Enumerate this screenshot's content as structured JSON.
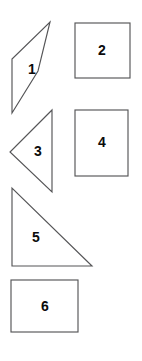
{
  "figure": {
    "background_color": "#ffffff",
    "outline_color": "#555557",
    "label_color": "#0b0b0b",
    "canvas": {
      "width": 142,
      "height": 361
    }
  },
  "shapes": [
    {
      "label": "1",
      "type": "parallelogram",
      "points": "50,22 38,71 12,113 12,59",
      "label_x": 32,
      "label_y": 70
    },
    {
      "label": "2",
      "type": "square",
      "x": 75,
      "y": 23,
      "width": 55,
      "height": 55,
      "label_x": 102,
      "label_y": 51
    },
    {
      "label": "3",
      "type": "triangle-left",
      "points": "52,110 52,192 10,152",
      "label_x": 38,
      "label_y": 152
    },
    {
      "label": "4",
      "type": "rectangle-vertical",
      "x": 75,
      "y": 110,
      "width": 53,
      "height": 66,
      "label_x": 102,
      "label_y": 143
    },
    {
      "label": "5",
      "type": "triangle-right",
      "points": "12,188 12,266 92,266",
      "label_x": 36,
      "label_y": 238
    },
    {
      "label": "6",
      "type": "rectangle-horizontal",
      "x": 11,
      "y": 280,
      "width": 67,
      "height": 52,
      "label_x": 45,
      "label_y": 307
    }
  ]
}
